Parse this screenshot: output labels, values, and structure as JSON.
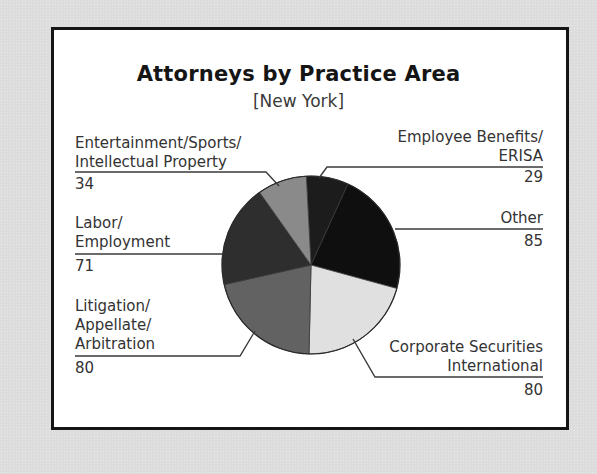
{
  "chart": {
    "title": "Attorneys by Practice Area",
    "subtitle": "[New York]"
  },
  "labels": {
    "entertainment": {
      "line1": "Entertainment/Sports/",
      "line2": "Intellectual Property",
      "value": "34"
    },
    "labor": {
      "line1": "Labor/",
      "line2": "Employment",
      "value": "71"
    },
    "litigation": {
      "line1": "Litigation/",
      "line2": "Appellate/",
      "line3": "Arbitration",
      "value": "80"
    },
    "employee_benefits": {
      "line1": "Employee Benefits/",
      "line2": "ERISA",
      "value": "29"
    },
    "other": {
      "line1": "Other",
      "value": "85"
    },
    "corporate": {
      "line1": "Corporate Securities",
      "line2": "International",
      "value": "80"
    }
  },
  "chart_data": {
    "type": "pie",
    "title": "Attorneys by Practice Area",
    "subtitle": "[New York]",
    "categories": [
      "Employee Benefits/ERISA",
      "Other",
      "Corporate Securities International",
      "Litigation/Appellate/Arbitration",
      "Labor/Employment",
      "Entertainment/Sports/Intellectual Property"
    ],
    "values": [
      29,
      85,
      80,
      80,
      71,
      34
    ],
    "colors": [
      "#1c1c1c",
      "#0f0f0f",
      "#e0e0e0",
      "#626262",
      "#2e2e2e",
      "#8a8a8a"
    ],
    "start_angle_deg": -3,
    "direction": "clockwise",
    "legend": "none (callout labels)"
  }
}
